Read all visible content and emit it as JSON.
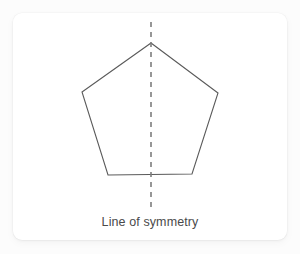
{
  "figure": {
    "title": "Line of symmetry",
    "caption": "Line of symmetry",
    "shape_name": "pentagon",
    "shape_sides": 5,
    "symmetry_line_orientation": "vertical",
    "colors": {
      "page_background": "#fcfcfc",
      "card_background": "#ffffff",
      "shape_stroke": "#5a5a5a",
      "shape_fill": "#ffffff",
      "symmetry_line": "#7d7d7d",
      "caption_text": "#4a4a4a"
    },
    "geometry": {
      "pentagon_points": "151,43 218,93 192,174 108,175 82,92",
      "pentagon_vertices": [
        {
          "name": "apex",
          "x": 151,
          "y": 43
        },
        {
          "name": "right",
          "x": 218,
          "y": 93
        },
        {
          "name": "bottom-right",
          "x": 192,
          "y": 174
        },
        {
          "name": "bottom-left",
          "x": 108,
          "y": 175
        },
        {
          "name": "left",
          "x": 82,
          "y": 92
        }
      ],
      "symmetry_line": {
        "x1": 151,
        "y1": 22,
        "x2": 151,
        "y2": 207,
        "dash": "5 5",
        "width": 1.6
      },
      "shape_stroke_width": 1.1,
      "card": {
        "x": 13,
        "y": 13,
        "width": 274,
        "height": 227,
        "radius": 9
      }
    }
  }
}
